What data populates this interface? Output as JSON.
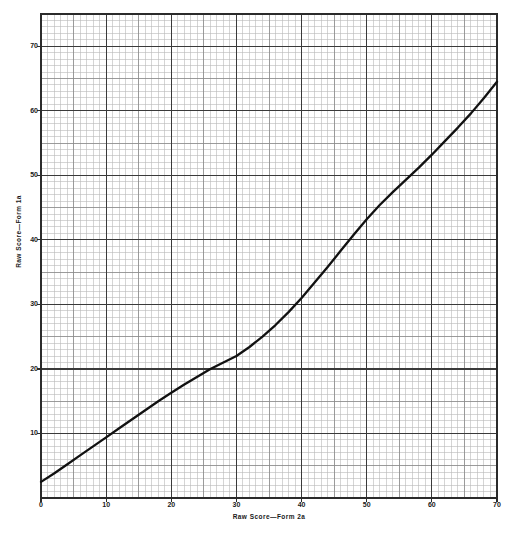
{
  "chart_data": {
    "type": "line",
    "title": "",
    "subtitle": "",
    "xlabel": "Raw Score—Form 2a",
    "ylabel": "Raw Score—Form 1a",
    "xlim": [
      0,
      70
    ],
    "ylim": [
      0,
      75
    ],
    "xticks": [
      0,
      10,
      20,
      30,
      40,
      50,
      60,
      70
    ],
    "xtick_labels": [
      "0",
      "10",
      "20",
      "30",
      "40",
      "50",
      "60",
      "70"
    ],
    "yticks": [
      10,
      20,
      30,
      40,
      50,
      60,
      70
    ],
    "ytick_labels": [
      "10",
      "20",
      "30",
      "40",
      "50",
      "60",
      "70"
    ],
    "grid": "graph-paper minor 1 unit, medium every 5 units, heavy every 10 units",
    "grid_minor_step": 1,
    "grid_medium_step": 5,
    "grid_major_step": 10,
    "legend": null,
    "legend_position": "none",
    "annotations": [],
    "series": [
      {
        "name": "Form 2a to Form 1a equipercentile equating curve",
        "line_color": "#111111",
        "line_width_px": 2.3,
        "x": [
          0,
          2,
          4,
          6,
          8,
          10,
          12,
          14,
          16,
          18,
          20,
          22,
          24,
          26,
          28,
          30,
          32,
          34,
          36,
          38,
          40,
          42,
          44,
          46,
          48,
          50,
          52,
          54,
          56,
          58,
          60,
          62,
          64,
          66,
          68,
          70
        ],
        "y": [
          2.5,
          3.8,
          5.2,
          6.6,
          8.0,
          9.4,
          10.8,
          12.2,
          13.6,
          15.0,
          16.3,
          17.6,
          18.8,
          20.0,
          21.0,
          22.0,
          23.4,
          25.0,
          26.8,
          28.8,
          31.0,
          33.4,
          35.8,
          38.3,
          40.8,
          43.2,
          45.4,
          47.4,
          49.3,
          51.2,
          53.2,
          55.3,
          57.4,
          59.6,
          62.0,
          64.5
        ]
      }
    ]
  },
  "axes": {
    "plot_left_px": 41,
    "plot_top_px": 14,
    "plot_right_px": 497,
    "plot_bottom_px": 498
  },
  "colors": {
    "background": "#ffffff",
    "curve": "#111111",
    "grid_minor": "#b9b9b9",
    "grid_medium": "#8a8a8a",
    "grid_major": "#3a3a3a",
    "frame": "#2b2b2b",
    "text": "#1a1a1a"
  },
  "footer": {
    "smudge_text": ""
  }
}
